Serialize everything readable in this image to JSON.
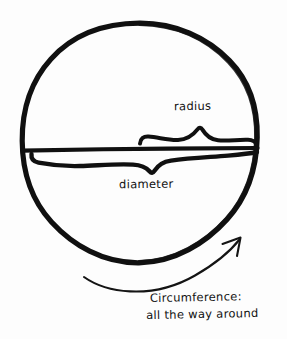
{
  "figure": {
    "style": "hand-drawn marker sketch",
    "background_color": "#fdfdfd",
    "ink_color": "#101010"
  },
  "labels": {
    "radius": "radius",
    "diameter": "diameter",
    "circumference_line1": "Circumference:",
    "circumference_line2": "all the way around"
  },
  "shapes": {
    "circle": {
      "name": "hand-drawn-circle",
      "center_x": 139,
      "center_y": 143,
      "radius_x": 118,
      "radius_y": 120,
      "stroke_width": 5
    },
    "diameter_line": {
      "name": "diameter-line",
      "x1": 22,
      "y1": 150,
      "x2": 257,
      "y2": 148,
      "stroke_width": 4
    },
    "radius_brace": {
      "name": "radius-brace",
      "x_start": 140,
      "x_end": 257,
      "y": 137,
      "stroke_width": 4
    },
    "diameter_brace": {
      "name": "diameter-brace",
      "x_start": 32,
      "x_end": 257,
      "y": 161,
      "stroke_width": 4
    },
    "circumference_arrow": {
      "name": "circumference-arrow",
      "tail_x": 84,
      "tail_y": 277,
      "head_x": 240,
      "head_y": 238,
      "stroke_width": 2,
      "direction": "clockwise-up-right"
    }
  }
}
